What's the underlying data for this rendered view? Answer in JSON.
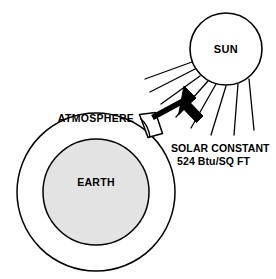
{
  "figure": {
    "type": "schematic-diagram",
    "background_color": "#ffffff",
    "stroke_color": "#000000"
  },
  "sun": {
    "label": "SUN",
    "fill_color": "#ffffff",
    "stroke_color": "#000000",
    "center": {
      "x": 226,
      "y": 49
    },
    "radius": 36,
    "ray_count": 8
  },
  "earth": {
    "label": "EARTH",
    "fill_color": "#e3e3e3",
    "stroke_color": "#000000",
    "center": {
      "x": 96,
      "y": 192
    },
    "radius": 53
  },
  "atmosphere": {
    "label": "ATMOSPHERE",
    "fill_color": "#ffffff",
    "stroke_color": "#000000",
    "center": {
      "x": 96,
      "y": 192
    },
    "radius": 79
  },
  "incident_patch": {
    "name": "unit-area-patch",
    "fill_color": "#ffffff",
    "stroke_color": "#000000"
  },
  "arrow": {
    "name": "solar-flux-arrow",
    "fill_color": "#000000",
    "direction": "down-left"
  },
  "annotation": {
    "line1": "SOLAR CONSTANT",
    "line2": "524 Btu/SQ FT",
    "value": 524,
    "unit": "Btu/SQ FT"
  }
}
